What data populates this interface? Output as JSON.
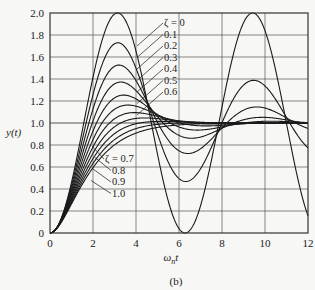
{
  "chart_data": {
    "type": "line",
    "title": "",
    "caption": "(b)",
    "xlabel": "ω_n t",
    "ylabel": "y(t)",
    "xlim": [
      0,
      12
    ],
    "ylim": [
      0,
      2.0
    ],
    "xticks": [
      0,
      2,
      4,
      6,
      8,
      10,
      12
    ],
    "xtick_labels": [
      "0",
      "2",
      "4",
      "6",
      "8",
      "10",
      "12"
    ],
    "yticks": [
      0,
      0.2,
      0.4,
      0.6,
      0.8,
      1.0,
      1.2,
      1.4,
      1.6,
      1.8,
      2.0
    ],
    "ytick_labels": [
      "0",
      "0.2",
      "0.4",
      "0.6",
      "0.8",
      "1.0",
      "1.2",
      "1.4",
      "1.6",
      "1.8",
      "2.0"
    ],
    "grid": true,
    "grid_x": [
      2,
      4,
      6,
      8,
      10
    ],
    "grid_y": [
      0.2,
      0.4,
      0.6,
      0.8,
      1.0,
      1.2,
      1.4,
      1.6,
      1.8
    ],
    "equation": "y(t) = 1 - e^(-ζ ω_n t) [cos(ω_d t) + ζ/√(1-ζ²) sin(ω_d t)], ω_d = ω_n √(1-ζ²)",
    "series": [
      {
        "name": "ζ = 0",
        "zeta": 0.0,
        "peak": 2.0,
        "peak_x": 3.14
      },
      {
        "name": "0.1",
        "zeta": 0.1,
        "peak": 1.73,
        "peak_x": 3.16
      },
      {
        "name": "0.2",
        "zeta": 0.2,
        "peak": 1.53,
        "peak_x": 3.21
      },
      {
        "name": "0.3",
        "zeta": 0.3,
        "peak": 1.37,
        "peak_x": 3.29
      },
      {
        "name": "0.4",
        "zeta": 0.4,
        "peak": 1.25,
        "peak_x": 3.43
      },
      {
        "name": "0.5",
        "zeta": 0.5,
        "peak": 1.16,
        "peak_x": 3.63
      },
      {
        "name": "0.6",
        "zeta": 0.6,
        "peak": 1.09,
        "peak_x": 3.93
      },
      {
        "name": "ζ = 0.7",
        "zeta": 0.7,
        "peak": 1.05,
        "peak_x": 4.4
      },
      {
        "name": "0.8",
        "zeta": 0.8,
        "peak": 1.02,
        "peak_x": 5.24
      },
      {
        "name": "0.9",
        "zeta": 0.9,
        "peak": 1.0,
        "peak_x": 7.21
      },
      {
        "name": "1.0",
        "zeta": 1.0,
        "peak": 1.0,
        "peak_x": null
      }
    ],
    "annotations": {
      "upper_group": {
        "labels": [
          "ζ = 0",
          "0.1",
          "0.2",
          "0.3",
          "0.4",
          "0.5",
          "0.6"
        ],
        "position": "upper-center"
      },
      "lower_group": {
        "labels": [
          "ζ = 0.7",
          "0.8",
          "0.9",
          "1.0"
        ],
        "position": "lower-left"
      }
    }
  },
  "style": {
    "line_color": "#1a1a1a",
    "grid_color": "#555555",
    "background": "#f7f7f5"
  }
}
